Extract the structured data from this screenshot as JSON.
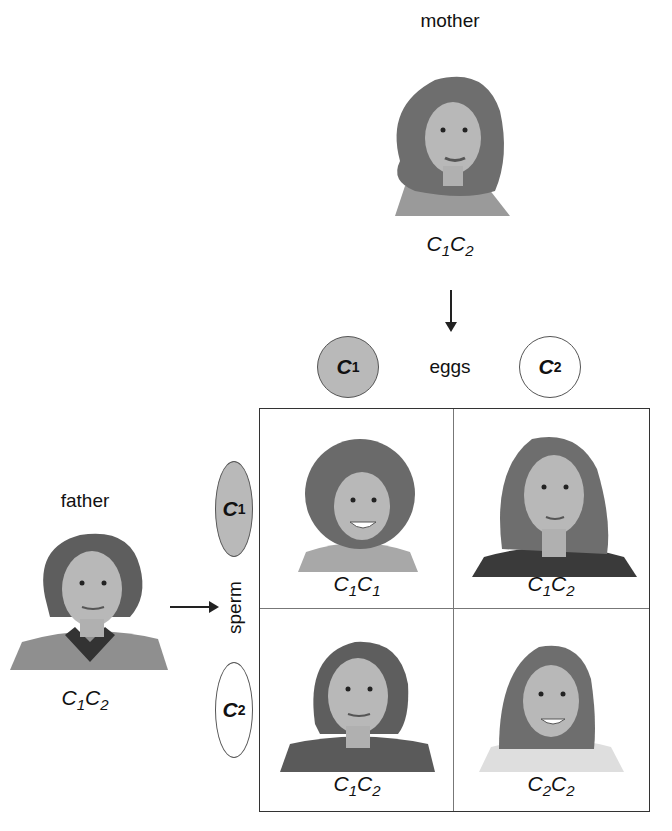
{
  "mother": {
    "label": "mother",
    "genotype": {
      "a": "C",
      "a_sub": "1",
      "b": "C",
      "b_sub": "2"
    }
  },
  "father": {
    "label": "father",
    "genotype": {
      "a": "C",
      "a_sub": "1",
      "b": "C",
      "b_sub": "2"
    }
  },
  "eggs": {
    "label": "eggs",
    "items": [
      {
        "allele": "C",
        "sub": "1",
        "fill": "#b9b9b9"
      },
      {
        "allele": "C",
        "sub": "2",
        "fill": "#ffffff"
      }
    ]
  },
  "sperm": {
    "label": "sperm",
    "items": [
      {
        "allele": "C",
        "sub": "1",
        "fill": "#b9b9b9"
      },
      {
        "allele": "C",
        "sub": "2",
        "fill": "#ffffff"
      }
    ]
  },
  "punnett": {
    "cells": [
      {
        "a": "C",
        "a_sub": "1",
        "b": "C",
        "b_sub": "1"
      },
      {
        "a": "C",
        "a_sub": "1",
        "b": "C",
        "b_sub": "2"
      },
      {
        "a": "C",
        "a_sub": "1",
        "b": "C",
        "b_sub": "2"
      },
      {
        "a": "C",
        "a_sub": "2",
        "b": "C",
        "b_sub": "2"
      }
    ]
  }
}
